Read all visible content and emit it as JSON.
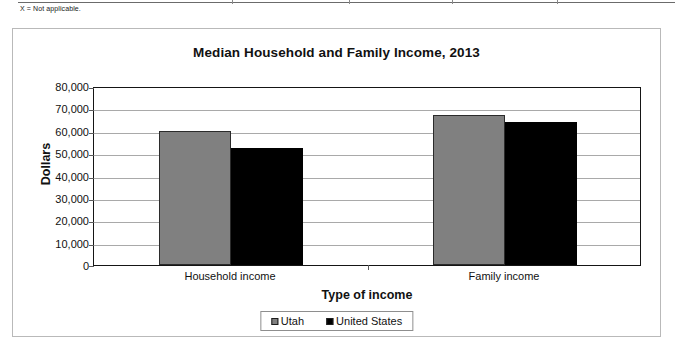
{
  "table_note": "X = Not applicable.",
  "chart_data": {
    "type": "bar",
    "title": "Median Household and Family Income, 2013",
    "xlabel": "Type of income",
    "ylabel": "Dollars",
    "categories": [
      "Household income",
      "Family income"
    ],
    "series": [
      {
        "name": "Utah",
        "color": "#808080",
        "values": [
          59700,
          67200
        ]
      },
      {
        "name": "United States",
        "color": "#000000",
        "values": [
          52200,
          63800
        ]
      }
    ],
    "ylim": [
      0,
      80000
    ],
    "yticks": [
      0,
      10000,
      20000,
      30000,
      40000,
      50000,
      60000,
      70000,
      80000
    ],
    "ytick_labels": [
      "0",
      "10,000",
      "20,000",
      "30,000",
      "40,000",
      "50,000",
      "60,000",
      "70,000",
      "80,000"
    ],
    "grid": true,
    "legend_position": "bottom-center"
  }
}
